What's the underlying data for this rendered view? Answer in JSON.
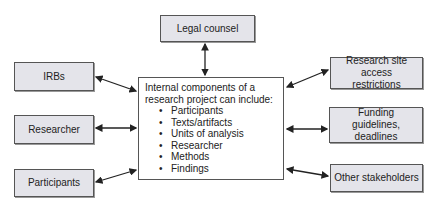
{
  "diagram": {
    "center": {
      "heading": "Internal components of a research project can include:",
      "items": [
        "Participants",
        "Texts/artifacts",
        "Units of analysis",
        "Researcher",
        "Methods",
        "Findings"
      ]
    },
    "nodes": {
      "legal_counsel": "Legal counsel",
      "irbs": "IRBs",
      "researcher": "Researcher",
      "participants": "Participants",
      "research_site": "Research site access restrictions",
      "funding": "Funding guidelines, deadlines",
      "other_stakeholders": "Other stakeholders"
    },
    "edges": [
      {
        "from": "legal_counsel",
        "to": "center",
        "type": "bidirectional"
      },
      {
        "from": "irbs",
        "to": "center",
        "type": "bidirectional"
      },
      {
        "from": "researcher",
        "to": "center",
        "type": "bidirectional"
      },
      {
        "from": "participants",
        "to": "center",
        "type": "bidirectional"
      },
      {
        "from": "research_site",
        "to": "center",
        "type": "bidirectional"
      },
      {
        "from": "funding",
        "to": "center",
        "type": "bidirectional"
      },
      {
        "from": "other_stakeholders",
        "to": "center",
        "type": "bidirectional"
      }
    ],
    "colors": {
      "node_fill": "#e4e4ea",
      "border": "#555555",
      "center_fill": "#ffffff"
    }
  }
}
